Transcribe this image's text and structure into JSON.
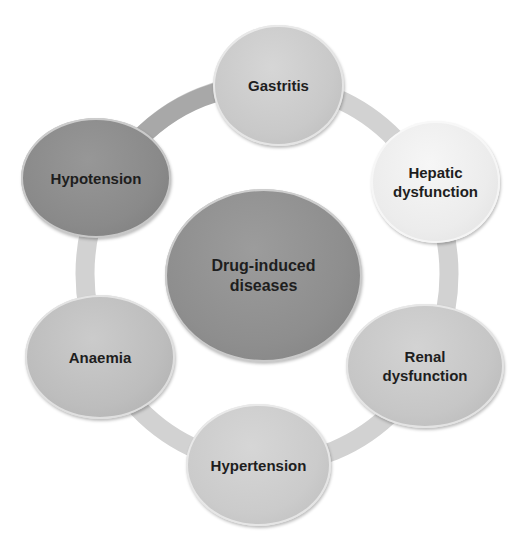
{
  "diagram": {
    "type": "cycle",
    "center": {
      "label": "Drug-induced\ndiseases",
      "color": "#8e8e8e"
    },
    "nodes": [
      {
        "label": "Gastritis",
        "color": "#c9c9c9"
      },
      {
        "label": "Hepatic\ndysfunction",
        "color": "#ececec"
      },
      {
        "label": "Renal\ndysfunction",
        "color": "#c6c6c6"
      },
      {
        "label": "Hypertension",
        "color": "#cbcbcb"
      },
      {
        "label": "Anaemia",
        "color": "#bdbdbd"
      },
      {
        "label": "Hypotension",
        "color": "#8a8a8a"
      }
    ],
    "ring_colors": {
      "light": "#d2d2d2",
      "dark": "#a5a5a5"
    }
  }
}
